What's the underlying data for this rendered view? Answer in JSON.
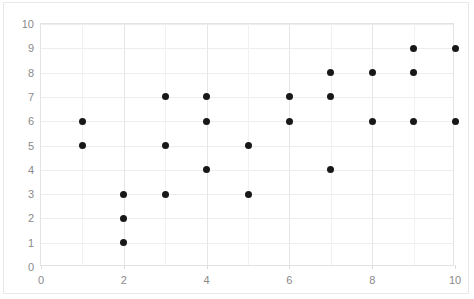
{
  "chart_data": {
    "type": "scatter",
    "title": "",
    "xlabel": "",
    "ylabel": "",
    "xlim": [
      0,
      10
    ],
    "ylim": [
      0,
      10
    ],
    "grid": true,
    "legend": false,
    "x_ticks": [
      0,
      2,
      4,
      6,
      8,
      10
    ],
    "x_minor_ticks": [
      1,
      3,
      5,
      7,
      9
    ],
    "y_ticks": [
      0,
      1,
      2,
      3,
      4,
      5,
      6,
      7,
      8,
      9,
      10
    ],
    "marker": {
      "shape": "circle",
      "color": "#181818",
      "size": 7
    },
    "series": [
      {
        "name": "Series 1",
        "points": [
          {
            "x": 1,
            "y": 6
          },
          {
            "x": 1,
            "y": 5
          },
          {
            "x": 2,
            "y": 3
          },
          {
            "x": 2,
            "y": 2
          },
          {
            "x": 2,
            "y": 1
          },
          {
            "x": 3,
            "y": 7
          },
          {
            "x": 3,
            "y": 5
          },
          {
            "x": 3,
            "y": 3
          },
          {
            "x": 4,
            "y": 7
          },
          {
            "x": 4,
            "y": 6
          },
          {
            "x": 4,
            "y": 4
          },
          {
            "x": 5,
            "y": 5
          },
          {
            "x": 5,
            "y": 3
          },
          {
            "x": 6,
            "y": 7
          },
          {
            "x": 6,
            "y": 6
          },
          {
            "x": 7,
            "y": 8
          },
          {
            "x": 7,
            "y": 7
          },
          {
            "x": 7,
            "y": 4
          },
          {
            "x": 8,
            "y": 8
          },
          {
            "x": 8,
            "y": 6
          },
          {
            "x": 9,
            "y": 9
          },
          {
            "x": 9,
            "y": 8
          },
          {
            "x": 9,
            "y": 6
          },
          {
            "x": 10,
            "y": 9
          },
          {
            "x": 10,
            "y": 6
          }
        ]
      }
    ]
  },
  "colors": {
    "marker": "#181818",
    "gridline": "#ededed",
    "axis_text": "#8a8a8a",
    "frame_border": "#e8e8e8",
    "plot_border": "#e3e3e3"
  }
}
